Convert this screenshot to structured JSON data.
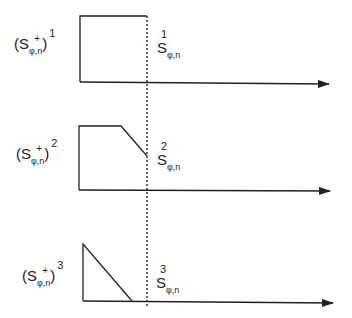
{
  "figure": {
    "type": "signal-shape diagram",
    "plots": [
      {
        "id": 1,
        "left_label": {
          "base": "S",
          "plus": "+",
          "sub": "φ,n",
          "power": "1"
        },
        "right_label": {
          "base": "S",
          "sub": "φ,n",
          "sup": "1"
        },
        "shape": "rectangle"
      },
      {
        "id": 2,
        "left_label": {
          "base": "S",
          "plus": "+",
          "sub": "φ,n",
          "power": "2"
        },
        "right_label": {
          "base": "S",
          "sub": "φ,n",
          "sup": "2"
        },
        "shape": "trapezoid-ramp-down"
      },
      {
        "id": 3,
        "left_label": {
          "base": "S",
          "plus": "+",
          "sub": "φ,n",
          "power": "3"
        },
        "right_label": {
          "base": "S",
          "sub": "φ,n",
          "sup": "3"
        },
        "shape": "triangle-ramp-down"
      }
    ],
    "colors": {
      "line": "#222222",
      "background": "#ffffff"
    },
    "paren_open": "(",
    "paren_close": ")"
  }
}
